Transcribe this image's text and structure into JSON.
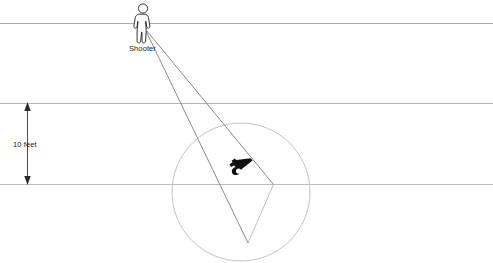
{
  "diagram": {
    "type": "technical-line-diagram",
    "background_color": "#ffffff",
    "line_color": "#b0b0b0",
    "dark_line_color": "#9a9a9a",
    "text_color": "#1a1a1a",
    "labels": {
      "shooter": "Shooter",
      "distance": "10 feet"
    },
    "icons": {
      "shooter": "person-icon",
      "weapon": "handgun-icon",
      "dimension_arrow": "double-headed-vertical-arrow-icon"
    },
    "geometry": {
      "horizontal_lines": [
        {
          "name": "top-reference-line",
          "y": 23,
          "x1": 0,
          "x2": 493
        },
        {
          "name": "middle-reference-line",
          "y": 103,
          "x1": 0,
          "x2": 493
        },
        {
          "name": "bottom-reference-line",
          "y": 184,
          "x1": 0,
          "x2": 493
        }
      ],
      "shooter_position": {
        "x": 143,
        "y": 30
      },
      "cone_left_edge": {
        "x1": 146,
        "y1": 31,
        "x2": 248,
        "y2": 243
      },
      "cone_right_edge": {
        "x1": 146,
        "y1": 31,
        "x2": 273,
        "y2": 184
      },
      "cone_base": {
        "x1": 273,
        "y1": 184,
        "x2": 248,
        "y2": 243
      },
      "circle": {
        "cx": 241,
        "cy": 192,
        "r": 69
      },
      "weapon_position": {
        "x": 241,
        "y": 166
      },
      "dimension_arrow": {
        "x": 27,
        "y_top": 103,
        "y_bottom": 184
      }
    }
  }
}
